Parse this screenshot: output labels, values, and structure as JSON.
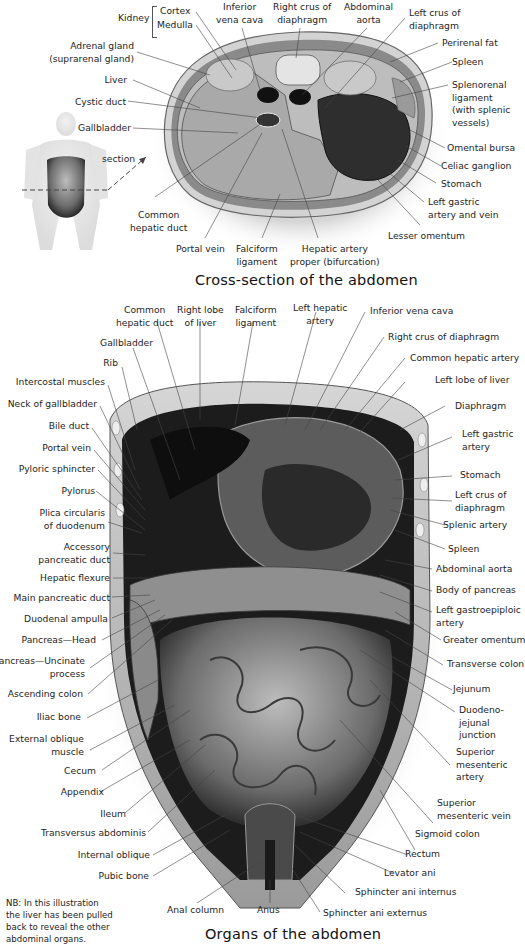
{
  "cross_section": {
    "title": "Cross-section of the abdomen",
    "kidney_group": {
      "label": "Kidney",
      "parts": [
        "Cortex",
        "Medulla"
      ]
    },
    "labels_top": [
      {
        "id": "inferior-vena-cava",
        "text": "Inferior\nvena cava"
      },
      {
        "id": "right-crus-of-diaphragm",
        "text": "Right crus of\ndiaphragm"
      },
      {
        "id": "abdominal-aorta",
        "text": "Abdominal\naorta"
      },
      {
        "id": "left-crus-of-diaphragm",
        "text": "Left crus of\ndiaphragm"
      }
    ],
    "labels_left": [
      {
        "id": "adrenal-gland",
        "text": "Adrenal gland\n(suprarenal gland)"
      },
      {
        "id": "liver",
        "text": "Liver"
      },
      {
        "id": "cystic-duct",
        "text": "Cystic duct"
      },
      {
        "id": "gallbladder",
        "text": "Gallbladder"
      },
      {
        "id": "section",
        "text": "section"
      }
    ],
    "labels_right": [
      {
        "id": "perirenal-fat",
        "text": "Perirenal fat"
      },
      {
        "id": "spleen",
        "text": "Spleen"
      },
      {
        "id": "splenorenal-ligament",
        "text": "Splenorenal\nligament\n(with splenic\nvessels)"
      },
      {
        "id": "omental-bursa",
        "text": "Omental bursa"
      },
      {
        "id": "celiac-ganglion",
        "text": "Celiac ganglion"
      },
      {
        "id": "stomach",
        "text": "Stomach"
      },
      {
        "id": "left-gastric-artery-and-vein",
        "text": "Left gastric\nartery and vein"
      },
      {
        "id": "lesser-omentum",
        "text": "Lesser omentum"
      }
    ],
    "labels_bottom": [
      {
        "id": "common-hepatic-duct",
        "text": "Common\nhepatic duct"
      },
      {
        "id": "portal-vein",
        "text": "Portal vein"
      },
      {
        "id": "falciform-ligament",
        "text": "Falciform\nligament"
      },
      {
        "id": "hepatic-artery-proper",
        "text": "Hepatic artery\nproper (bifurcation)"
      }
    ]
  },
  "organs": {
    "title": "Organs of the abdomen",
    "labels_top": [
      {
        "id": "common-hepatic-duct",
        "text": "Common\nhepatic duct"
      },
      {
        "id": "right-lobe-of-liver",
        "text": "Right lobe\nof liver"
      },
      {
        "id": "falciform-ligament",
        "text": "Falciform\nligament"
      },
      {
        "id": "left-hepatic-artery",
        "text": "Left hepatic\nartery"
      },
      {
        "id": "inferior-vena-cava",
        "text": "Inferior vena cava"
      }
    ],
    "labels_left": [
      {
        "id": "gallbladder",
        "text": "Gallbladder"
      },
      {
        "id": "rib",
        "text": "Rib"
      },
      {
        "id": "intercostal-muscles",
        "text": "Intercostal muscles"
      },
      {
        "id": "neck-of-gallbladder",
        "text": "Neck of gallbladder"
      },
      {
        "id": "bile-duct",
        "text": "Bile duct"
      },
      {
        "id": "portal-vein",
        "text": "Portal vein"
      },
      {
        "id": "pyloric-sphincter",
        "text": "Pyloric sphincter"
      },
      {
        "id": "pylorus",
        "text": "Pylorus"
      },
      {
        "id": "plica-circularis",
        "text": "Plica circularis\nof duodenum"
      },
      {
        "id": "accessory-pancreatic-duct",
        "text": "Accessory\npancreatic duct"
      },
      {
        "id": "hepatic-flexure",
        "text": "Hepatic flexure"
      },
      {
        "id": "main-pancreatic-duct",
        "text": "Main pancreatic duct"
      },
      {
        "id": "duodenal-ampulla",
        "text": "Duodenal ampulla"
      },
      {
        "id": "pancreas-head",
        "text": "Pancreas—Head"
      },
      {
        "id": "pancreas-uncinate",
        "text": "Pancreas—Uncinate\nprocess"
      },
      {
        "id": "ascending-colon",
        "text": "Ascending colon"
      },
      {
        "id": "iliac-bone",
        "text": "Iliac bone"
      },
      {
        "id": "external-oblique",
        "text": "External oblique\nmuscle"
      },
      {
        "id": "cecum",
        "text": "Cecum"
      },
      {
        "id": "appendix",
        "text": "Appendix"
      },
      {
        "id": "ileum",
        "text": "Ileum"
      },
      {
        "id": "transversus-abdominis",
        "text": "Transversus abdominis"
      },
      {
        "id": "internal-oblique",
        "text": "Internal oblique"
      },
      {
        "id": "pubic-bone",
        "text": "Pubic bone"
      }
    ],
    "labels_right": [
      {
        "id": "right-crus-of-diaphragm",
        "text": "Right crus of diaphragm"
      },
      {
        "id": "common-hepatic-artery",
        "text": "Common hepatic artery"
      },
      {
        "id": "left-lobe-of-liver",
        "text": "Left lobe of liver"
      },
      {
        "id": "diaphragm",
        "text": "Diaphragm"
      },
      {
        "id": "left-gastric-artery",
        "text": "Left gastric\nartery"
      },
      {
        "id": "stomach",
        "text": "Stomach"
      },
      {
        "id": "left-crus-of-diaphragm",
        "text": "Left crus of\ndiaphragm"
      },
      {
        "id": "splenic-artery",
        "text": "Splenic artery"
      },
      {
        "id": "spleen",
        "text": "Spleen"
      },
      {
        "id": "abdominal-aorta",
        "text": "Abdominal aorta"
      },
      {
        "id": "body-of-pancreas",
        "text": "Body of pancreas"
      },
      {
        "id": "left-gastroepiploic-artery",
        "text": "Left gastroepiploic\nartery"
      },
      {
        "id": "greater-omentum",
        "text": "Greater omentum"
      },
      {
        "id": "transverse-colon",
        "text": "Transverse colon"
      },
      {
        "id": "jejunum",
        "text": "Jejunum"
      },
      {
        "id": "duodenojejunal-junction",
        "text": "Duodeno-\njejunal\njunction"
      },
      {
        "id": "superior-mesenteric-artery",
        "text": "Superior\nmesenteric\nartery"
      },
      {
        "id": "superior-mesenteric-vein",
        "text": "Superior\nmesenteric vein"
      },
      {
        "id": "sigmoid-colon",
        "text": "Sigmoid colon"
      },
      {
        "id": "rectum",
        "text": "Rectum"
      },
      {
        "id": "levator-ani",
        "text": "Levator ani"
      },
      {
        "id": "sphincter-ani-internus",
        "text": "Sphincter ani internus"
      },
      {
        "id": "sphincter-ani-externus",
        "text": "Sphincter ani externus"
      }
    ],
    "labels_bottom": [
      {
        "id": "anal-column",
        "text": "Anal column"
      },
      {
        "id": "anus",
        "text": "Anus"
      }
    ],
    "note": "NB: In this illustration\nthe liver has been pulled\nback to reveal the other\nabdominal organs."
  }
}
